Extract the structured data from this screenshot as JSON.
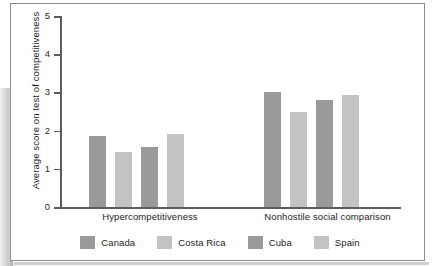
{
  "chart_data": {
    "type": "bar",
    "title": "",
    "xlabel": "",
    "ylabel": "Average score on test of competitiveness",
    "ylim": [
      0,
      5
    ],
    "ytick_labels": [
      "5",
      "4",
      "3",
      "2",
      "1",
      "0"
    ],
    "ytick_values": [
      5,
      4,
      3,
      2,
      1,
      0
    ],
    "grid": false,
    "legend_position": "bottom",
    "categories": [
      "Hypercompetitiveness",
      "Nonhostile social comparison"
    ],
    "series": [
      {
        "name": "Canada",
        "color": "#9a9a9a",
        "values": [
          1.87,
          3.0
        ]
      },
      {
        "name": "Costa Rica",
        "color": "#c3c3c3",
        "values": [
          1.43,
          2.48
        ]
      },
      {
        "name": "Cuba",
        "color": "#9a9a9a",
        "values": [
          1.56,
          2.8
        ]
      },
      {
        "name": "Spain",
        "color": "#c3c3c3",
        "values": [
          1.9,
          2.93
        ]
      }
    ]
  },
  "axis": {
    "tick_5": "5",
    "tick_4": "4",
    "tick_3": "3",
    "tick_2": "2",
    "tick_1": "1",
    "tick_0": "0",
    "y_title": "Average score on test of competitiveness"
  },
  "categories": {
    "group_1": "Hypercompetitiveness",
    "group_2": "Nonhostile social comparison"
  },
  "legend": {
    "item_1": "Canada",
    "item_2": "Costa Rica",
    "item_3": "Cuba",
    "item_4": "Spain"
  },
  "colors": {
    "bar_dark": "#9a9a9a",
    "bar_light": "#c3c3c3",
    "axis": "#5d5d5d",
    "frame": "#8e8e8e",
    "text": "#1c1c1c",
    "background": "#ffffff"
  }
}
